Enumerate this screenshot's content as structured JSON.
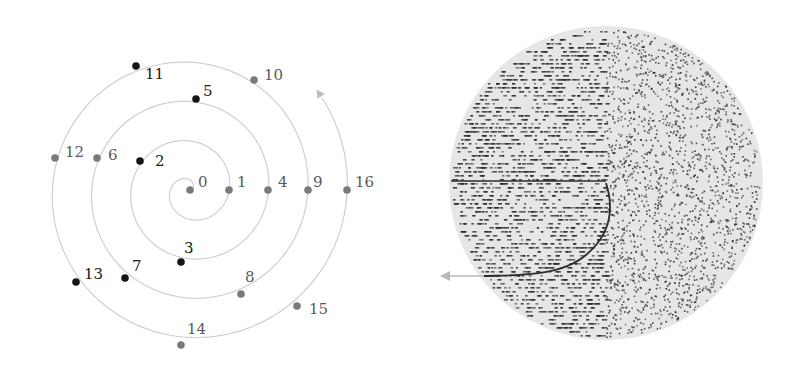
{
  "spiral_panel": {
    "center": [
      190,
      190
    ],
    "turn_spacing": 39.3,
    "curve_color": "#cfcfcf",
    "arrow_color": "#bdbdbd",
    "gray_dot_color": "#7a7a7a",
    "black_dot_color": "#151515",
    "gray_label_color": "#5a5a5a",
    "black_label_color": "#1a1a1a",
    "points": [
      {
        "n": "0",
        "x": 190,
        "y": 190,
        "kind": "gray",
        "lx": 198,
        "ly": 187
      },
      {
        "n": "1",
        "x": 229,
        "y": 190,
        "kind": "gray",
        "lx": 237,
        "ly": 187
      },
      {
        "n": "2",
        "x": 140,
        "y": 161,
        "kind": "black",
        "lx": 155,
        "ly": 166
      },
      {
        "n": "3",
        "x": 181,
        "y": 262,
        "kind": "black",
        "lx": 184,
        "ly": 253
      },
      {
        "n": "4",
        "x": 268,
        "y": 190,
        "kind": "gray",
        "lx": 278,
        "ly": 187
      },
      {
        "n": "5",
        "x": 196,
        "y": 99,
        "kind": "black",
        "lx": 203,
        "ly": 96
      },
      {
        "n": "6",
        "x": 97,
        "y": 158,
        "kind": "gray",
        "lx": 108,
        "ly": 160
      },
      {
        "n": "7",
        "x": 125,
        "y": 278,
        "kind": "black",
        "lx": 132,
        "ly": 271
      },
      {
        "n": "8",
        "x": 241,
        "y": 294,
        "kind": "gray",
        "lx": 245,
        "ly": 282
      },
      {
        "n": "9",
        "x": 308,
        "y": 190,
        "kind": "gray",
        "lx": 313,
        "ly": 187
      },
      {
        "n": "10",
        "x": 254,
        "y": 80,
        "kind": "gray",
        "lx": 264,
        "ly": 80
      },
      {
        "n": "11",
        "x": 136,
        "y": 66,
        "kind": "black",
        "lx": 145,
        "ly": 79
      },
      {
        "n": "12",
        "x": 55,
        "y": 158,
        "kind": "gray",
        "lx": 65,
        "ly": 157
      },
      {
        "n": "13",
        "x": 76,
        "y": 282,
        "kind": "black",
        "lx": 84,
        "ly": 279
      },
      {
        "n": "14",
        "x": 181,
        "y": 345,
        "kind": "gray",
        "lx": 187,
        "ly": 334
      },
      {
        "n": "15",
        "x": 297,
        "y": 306,
        "kind": "gray",
        "lx": 309,
        "ly": 314
      },
      {
        "n": "16",
        "x": 347,
        "y": 190,
        "kind": "gray",
        "lx": 355,
        "ly": 187
      }
    ]
  },
  "disc_panel": {
    "center": [
      606,
      183
    ],
    "radius": 157,
    "disc_color": "#e6e6e6",
    "dot_color": "#2a2a2a",
    "curve_color": "#2b2b2b",
    "arrow_color": "#b8b8b8",
    "dot_count": 3600,
    "arrow_tip": [
      440,
      276
    ]
  }
}
